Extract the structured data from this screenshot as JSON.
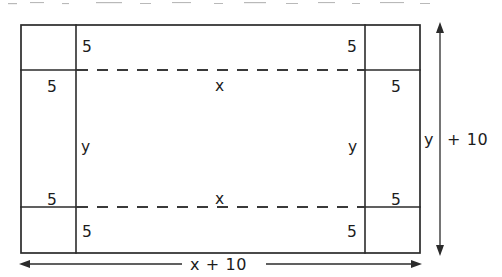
{
  "figure": {
    "colors": {
      "ink": "#2b2b2b",
      "dash": "#3a3a3a",
      "background": "#ffffff"
    },
    "border_labels": {
      "top_left_inner": "5",
      "top_right_inner": "5",
      "left_upper_outer": "5",
      "right_upper_outer": "5",
      "left_lower_outer": "5",
      "right_lower_outer": "5",
      "bottom_left_inner": "5",
      "bottom_right_inner": "5"
    },
    "inner_labels": {
      "top_width": "x",
      "bottom_width": "x",
      "left_height": "y",
      "right_height": "y"
    },
    "dimension_labels": {
      "vertical_var": "y",
      "vertical_rest": "+ 10",
      "vertical_full": "y + 10",
      "horizontal_full": "x + 10"
    },
    "geometry": {
      "outer": {
        "x1": 21,
        "y1": 25,
        "x2": 420,
        "y2": 253
      },
      "inner": {
        "x1": 76,
        "y1": 70,
        "x2": 365,
        "y2": 207
      },
      "vertical_dimension_x": 440,
      "horizontal_dimension_y": 264
    }
  }
}
